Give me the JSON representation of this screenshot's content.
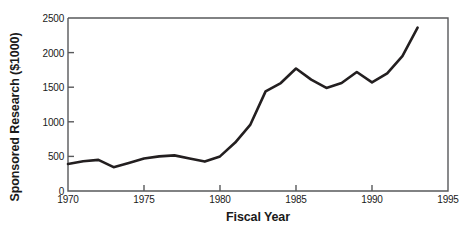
{
  "chart_data": {
    "type": "line",
    "title": "",
    "xlabel": "Fiscal Year",
    "ylabel": "Sponsored Research ($1000)",
    "xlim": [
      1970,
      1995
    ],
    "ylim": [
      0,
      2500
    ],
    "grid": false,
    "legend": null,
    "line_color": "#231f20",
    "axis_color": "#58595b",
    "x": [
      1970,
      1971,
      1972,
      1973,
      1974,
      1975,
      1976,
      1977,
      1978,
      1979,
      1980,
      1981,
      1982,
      1983,
      1984,
      1985,
      1986,
      1987,
      1988,
      1989,
      1990,
      1991,
      1992,
      1993
    ],
    "values": [
      390,
      430,
      450,
      345,
      405,
      470,
      500,
      515,
      470,
      425,
      500,
      700,
      960,
      1440,
      1560,
      1770,
      1610,
      1490,
      1560,
      1720,
      1570,
      1700,
      1950,
      2360
    ],
    "xticks": [
      1970,
      1975,
      1980,
      1985,
      1990,
      1995
    ],
    "xtick_labels": [
      "1970",
      "1975",
      "1980",
      "1985",
      "1990",
      "1995"
    ],
    "yticks": [
      0,
      500,
      1000,
      1500,
      2000,
      2500
    ],
    "ytick_labels": [
      "0",
      "500",
      "1000",
      "1500",
      "2000",
      "2500"
    ]
  }
}
